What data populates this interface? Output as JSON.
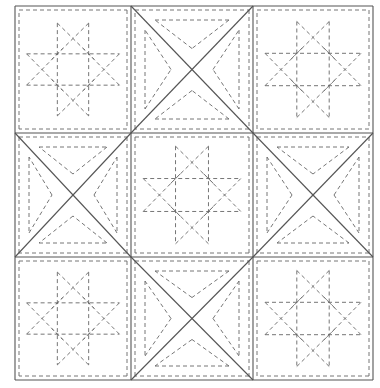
{
  "diagram": {
    "type": "quilt-block-pattern",
    "grid": {
      "rows": 3,
      "cols": 3
    },
    "frame": {
      "x0": 15,
      "y0": 6,
      "x1": 373,
      "y1": 380
    },
    "col_lines": [
      15,
      131,
      253,
      373
    ],
    "row_lines": [
      6,
      133,
      257,
      380
    ],
    "colors": {
      "solid": "#555555",
      "dashed": "#666666",
      "background": "#ffffff"
    },
    "layout": [
      [
        "star",
        "hourglass",
        "star"
      ],
      [
        "hourglass",
        "star",
        "hourglass"
      ],
      [
        "star",
        "hourglass",
        "star"
      ]
    ],
    "block_types": {
      "star": "Eight-point star: dashed center square with four crossed-diagonal points, dashed inner border",
      "hourglass": "Solid X diagonals dividing block into four triangles, each with dashed quilting outline, dashed inner border"
    }
  }
}
